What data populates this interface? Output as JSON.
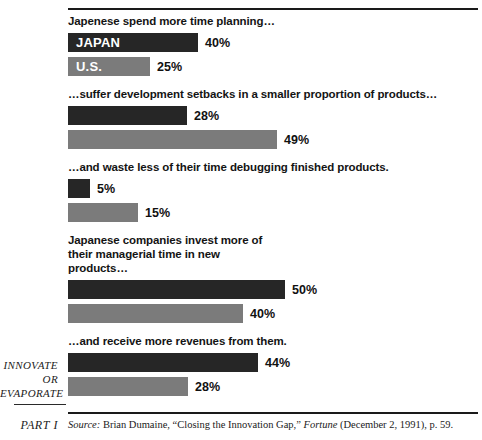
{
  "margin": {
    "running_head_lines": [
      "INNOVATE",
      "OR",
      "EVAPORATE"
    ],
    "part_label": "PART I"
  },
  "source": {
    "label": "Source:",
    "author": " Brian Dumaine, ",
    "article": "“Closing the Innovation Gap,” ",
    "publication": "Fortune",
    "details": " (December 2, 1991), p. 59."
  },
  "colors": {
    "japan_bar": "#262626",
    "us_bar": "#7b7b7b",
    "rule": "#1a1a1a",
    "text": "#111111"
  },
  "chart_data": {
    "type": "bar",
    "title": "",
    "xlabel": "",
    "ylabel": "",
    "orientation": "horizontal",
    "legend": [
      "JAPAN",
      "U.S."
    ],
    "grid": false,
    "groups": [
      {
        "heading": "Japenese spend more time planning…",
        "bars": [
          {
            "series": "JAPAN",
            "inner_label": "JAPAN",
            "value": 40,
            "value_label": "40%",
            "width_px": 130,
            "color": "#262626"
          },
          {
            "series": "U.S.",
            "inner_label": "U.S.",
            "value": 25,
            "value_label": "25%",
            "width_px": 82,
            "color": "#7b7b7b"
          }
        ]
      },
      {
        "heading": "…suffer development setbacks in a smaller proportion of products…",
        "bars": [
          {
            "series": "JAPAN",
            "inner_label": "",
            "value": 28,
            "value_label": "28%",
            "width_px": 119,
            "color": "#262626"
          },
          {
            "series": "U.S.",
            "inner_label": "",
            "value": 49,
            "value_label": "49%",
            "width_px": 209,
            "color": "#7b7b7b"
          }
        ]
      },
      {
        "heading": "…and waste less of their time debugging finished products.",
        "bars": [
          {
            "series": "JAPAN",
            "inner_label": "",
            "value": 5,
            "value_label": "5%",
            "width_px": 22,
            "color": "#262626"
          },
          {
            "series": "U.S.",
            "inner_label": "",
            "value": 15,
            "value_label": "15%",
            "width_px": 70,
            "color": "#7b7b7b"
          }
        ]
      },
      {
        "heading": "Japanese companies invest more of their managerial time in new products…",
        "bars": [
          {
            "series": "JAPAN",
            "inner_label": "",
            "value": 50,
            "value_label": "50%",
            "width_px": 217,
            "color": "#262626"
          },
          {
            "series": "U.S.",
            "inner_label": "",
            "value": 40,
            "value_label": "40%",
            "width_px": 175,
            "color": "#7b7b7b"
          }
        ]
      },
      {
        "heading": "…and receive more revenues from them.",
        "bars": [
          {
            "series": "JAPAN",
            "inner_label": "",
            "value": 44,
            "value_label": "44%",
            "width_px": 190,
            "color": "#262626"
          },
          {
            "series": "U.S.",
            "inner_label": "",
            "value": 28,
            "value_label": "28%",
            "width_px": 120,
            "color": "#7b7b7b"
          }
        ]
      }
    ]
  }
}
